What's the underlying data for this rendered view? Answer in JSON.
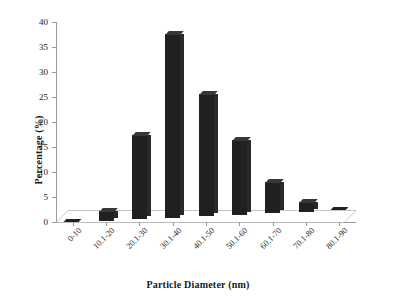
{
  "chart_data": {
    "type": "bar",
    "title": "",
    "xlabel": "Particle Diameter (nm)",
    "ylabel": "Percentage (%)",
    "categories": [
      "0-10",
      "10.1-20",
      "20.1-30",
      "30.1-40",
      "40.1-50",
      "50.1-60",
      "60.1-70",
      "70.1-80",
      "80.1-90"
    ],
    "values": [
      0,
      2.0,
      16.8,
      36.7,
      24.4,
      14.9,
      6.3,
      2.0,
      0
    ],
    "ylim": [
      0,
      40
    ],
    "yticks": [
      0,
      5,
      10,
      15,
      20,
      25,
      30,
      35,
      40
    ],
    "ytick_labels": [
      "0",
      "5",
      "10",
      "15",
      "20",
      "25",
      "30",
      "35",
      "40"
    ],
    "grid": false,
    "legend": false,
    "series": [
      {
        "name": "Percentage",
        "values": [
          0,
          2.0,
          16.8,
          36.7,
          24.4,
          14.9,
          6.3,
          2.0,
          0
        ]
      }
    ],
    "bar_color": "#221f1f",
    "axis_color": "#9a9a9a"
  }
}
